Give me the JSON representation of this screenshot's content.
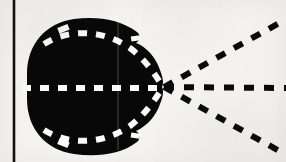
{
  "figure": {
    "kind": "scanned-technical-diagram",
    "caption": "",
    "background_color": "#f6f5f2",
    "ink_color": "#0a0a0a",
    "highlight_color": "#fbfbf8",
    "canvas": {
      "width": 286,
      "height": 162
    }
  },
  "axis_rule": {
    "name": "vertical-border-rule",
    "color": "#111111",
    "x": 14,
    "y_start": 0,
    "y_end": 162,
    "thickness": 2.6
  },
  "blob": {
    "name": "dark-body-region",
    "fill": "#080808",
    "center_x": 92,
    "center_y": 86,
    "radius_x": 68,
    "radius_y": 64,
    "apex_x": 162,
    "apex_y": 87,
    "path": "M 27 74 C 27 44 46 23 74 19 C 96 16 120 19 137 32 C 141 35 140 41 136 43 C 147 47 156 58 160 70 C 163 78 164 83 162 87 C 164 91 163 97 160 104 C 156 116 147 126 136 131 C 140 133 141 139 137 142 C 120 155 96 157 74 154 C 46 150 27 129 27 99 Z"
  },
  "internal_streamlines": {
    "name": "white-dashed-streamlines",
    "stroke": "#fbfbf8",
    "width": 6,
    "dash": "9 9",
    "lines": [
      {
        "id": "upper-arc",
        "path": "M 44 44 C 70 28 104 30 130 48 C 146 60 156 76 163 87"
      },
      {
        "id": "mid-axis",
        "path": "M 22 88 L 163 88"
      },
      {
        "id": "lower-arc",
        "path": "M 44 130 C 70 146 104 144 130 126 C 146 114 156 98 163 87"
      }
    ]
  },
  "cone_rays": {
    "name": "black-dashed-cone-rays",
    "stroke": "#0a0a0a",
    "width": 6,
    "dash": "10 10",
    "vertex": {
      "x": 164,
      "y": 87
    },
    "rays": [
      {
        "id": "upper-ray",
        "x2": 283,
        "y2": 21
      },
      {
        "id": "center-ray",
        "x2": 286,
        "y2": 88
      },
      {
        "id": "lower-ray",
        "x2": 283,
        "y2": 153
      }
    ]
  },
  "internal_divider": {
    "name": "faint-vertical-divider",
    "stroke": "#6e6e6e",
    "x": 118,
    "y_start": 22,
    "y_end": 150,
    "width": 1.2,
    "opacity": 0.55
  },
  "notches": [
    {
      "id": "top-left-notch",
      "x": 60,
      "y": 28,
      "w": 9,
      "h": 5
    },
    {
      "id": "bottom-left-notch",
      "x": 60,
      "y": 141,
      "w": 9,
      "h": 5
    }
  ]
}
